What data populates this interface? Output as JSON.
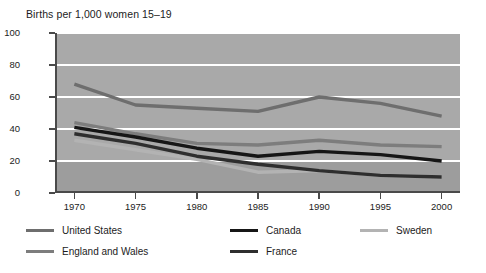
{
  "chart_data": {
    "type": "line",
    "title": "Births per 1,000 women 15–19",
    "xlabel": "",
    "ylabel": "",
    "x": [
      1970,
      1975,
      1980,
      1985,
      1990,
      1995,
      2000
    ],
    "xticklabels": [
      "1970",
      "1975",
      "1980",
      "1985",
      "1990",
      "1995",
      "2000"
    ],
    "yticklabels": [
      "0",
      "20",
      "40",
      "60",
      "80",
      "100"
    ],
    "yticks": [
      0,
      20,
      40,
      60,
      80,
      100
    ],
    "ylim": [
      0,
      100
    ],
    "xlim": [
      1968.5,
      2001.5
    ],
    "grid": "horizontal-white",
    "legend_position": "below-two-rows",
    "series": [
      {
        "name": "United States",
        "color": "#6e6e6e",
        "width": 3.4,
        "values": [
          68,
          55,
          53,
          51,
          60,
          56,
          48
        ]
      },
      {
        "name": "Canada",
        "color": "#161616",
        "width": 3.4,
        "values": [
          41,
          35,
          28,
          23,
          26,
          24,
          20
        ]
      },
      {
        "name": "Sweden",
        "color": "#b3b3b3",
        "width": 3.4,
        "values": [
          33,
          27,
          21,
          13,
          14,
          11,
          10
        ]
      },
      {
        "name": "England and Wales",
        "color": "#7d7d7d",
        "width": 3.4,
        "values": [
          44,
          37,
          31,
          30,
          33,
          30,
          29
        ]
      },
      {
        "name": "France",
        "color": "#2e2e2e",
        "width": 3.4,
        "values": [
          37,
          31,
          23,
          18,
          14,
          11,
          10
        ]
      }
    ]
  },
  "legend": {
    "items": [
      {
        "label": "United States",
        "color": "#6e6e6e"
      },
      {
        "label": "Canada",
        "color": "#161616"
      },
      {
        "label": "Sweden",
        "color": "#b3b3b3"
      },
      {
        "label": "England and Wales",
        "color": "#7d7d7d"
      },
      {
        "label": "France",
        "color": "#2e2e2e"
      }
    ]
  }
}
